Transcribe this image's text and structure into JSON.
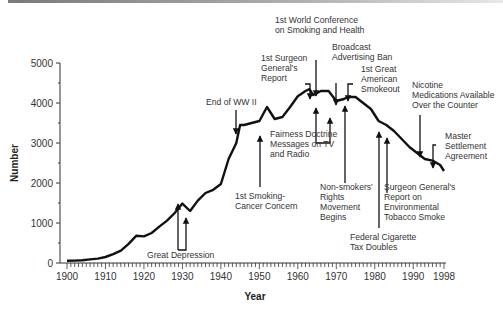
{
  "chart_data": {
    "type": "line",
    "title": "",
    "xlabel": "Year",
    "ylabel": "Number",
    "xlim": [
      1900,
      1998
    ],
    "ylim": [
      0,
      5000
    ],
    "grid": false,
    "legend": null,
    "x_ticks": [
      "1900",
      "1910",
      "1920",
      "1930",
      "1940",
      "1950",
      "1960",
      "1970",
      "1980",
      "1990",
      "1998"
    ],
    "y_ticks": [
      "0",
      "1000",
      "2000",
      "3000",
      "4000",
      "5000"
    ],
    "series": [
      {
        "name": "Adult per capita cigarette consumption",
        "x": [
          1900,
          1902,
          1904,
          1906,
          1908,
          1910,
          1912,
          1914,
          1916,
          1918,
          1920,
          1922,
          1924,
          1926,
          1928,
          1930,
          1932,
          1934,
          1936,
          1938,
          1940,
          1942,
          1944,
          1945,
          1946,
          1948,
          1950,
          1952,
          1954,
          1956,
          1958,
          1960,
          1962,
          1963,
          1964,
          1966,
          1968,
          1970,
          1972,
          1973,
          1975,
          1977,
          1979,
          1981,
          1983,
          1985,
          1987,
          1989,
          1991,
          1993,
          1995,
          1997,
          1998
        ],
        "values": [
          54,
          60,
          70,
          90,
          110,
          151,
          220,
          310,
          480,
          680,
          665,
          750,
          910,
          1060,
          1250,
          1485,
          1300,
          1560,
          1750,
          1830,
          1976,
          2600,
          3000,
          3450,
          3450,
          3500,
          3550,
          3900,
          3600,
          3650,
          3900,
          4170,
          4300,
          4345,
          4200,
          4300,
          4300,
          4050,
          4100,
          4150,
          4150,
          4000,
          3850,
          3550,
          3450,
          3300,
          3100,
          2900,
          2750,
          2600,
          2560,
          2450,
          2300
        ]
      }
    ],
    "annotations": [
      {
        "text": "Great Depression",
        "year": "1929-1932",
        "direction": "up"
      },
      {
        "text": "End of WW II",
        "year": 1945,
        "direction": "down"
      },
      {
        "text": "1st Smoking-Cancer Concern",
        "year": 1952,
        "direction": "up"
      },
      {
        "text": "1st Surgeon General's Report",
        "year": 1964,
        "direction": "down"
      },
      {
        "text": "1st World Conference on Smoking and Health",
        "year": 1967,
        "direction": "down"
      },
      {
        "text": "Fairness Doctrine Messages on TV and Radio",
        "year": "1967-1970",
        "direction": "up"
      },
      {
        "text": "Broadcast Advertising Ban",
        "year": 1971,
        "direction": "down"
      },
      {
        "text": "1st Great American Smokeout",
        "year": 1974,
        "direction": "down"
      },
      {
        "text": "Non-smokers' Rights Movement Begins",
        "year": 1974,
        "direction": "up"
      },
      {
        "text": "Federal Cigarette Tax Doubles",
        "year": 1983,
        "direction": "up"
      },
      {
        "text": "Surgeon General's Report on Environmental Tobacco Smoke",
        "year": 1986,
        "direction": "up"
      },
      {
        "text": "Nicotine Medications Available Over the Counter",
        "year": 1996,
        "direction": "down"
      },
      {
        "text": "Master Settlement Agreement",
        "year": 1998,
        "direction": "down"
      }
    ]
  },
  "labels": {
    "ylabel": "Number",
    "xlabel": "Year",
    "yticks": [
      "0",
      "1000",
      "2000",
      "3000",
      "4000",
      "5000"
    ],
    "xticks": [
      "1900",
      "1910",
      "1920",
      "1930",
      "1940",
      "1950",
      "1960",
      "1970",
      "1980",
      "1990",
      "1998"
    ],
    "ann": {
      "great_depression": "Great Depression",
      "end_ww2": "End of WW II",
      "smoking_cancer_1": "1st Smoking-",
      "smoking_cancer_2": "Cancer Concern",
      "surgeon_1": "1st Surgeon",
      "surgeon_2": "General's",
      "surgeon_3": "Report",
      "world_conf_1": "1st World Conference",
      "world_conf_2": "on Smoking and Health",
      "fairness_1": "Fairness Doctrine",
      "fairness_2": "Messages on TV",
      "fairness_3": "and Radio",
      "broadcast_1": "Broadcast",
      "broadcast_2": "Advertising Ban",
      "smokeout_1": "1st Great",
      "smokeout_2": "American",
      "smokeout_3": "Smokeout",
      "nonsmokers_1": "Non-smokers'",
      "nonsmokers_2": "Rights",
      "nonsmokers_3": "Movement",
      "nonsmokers_4": "Begins",
      "tax_1": "Federal Cigarette",
      "tax_2": "Tax Doubles",
      "ets_1": "Surgeon General's",
      "ets_2": "Report on",
      "ets_3": "Environmental",
      "ets_4": "Tobacco Smoke",
      "nicotine_1": "Nicotine",
      "nicotine_2": "Medications Available",
      "nicotine_3": "Over the Counter",
      "msa_1": "Master",
      "msa_2": "Settlement",
      "msa_3": "Agreement"
    }
  }
}
